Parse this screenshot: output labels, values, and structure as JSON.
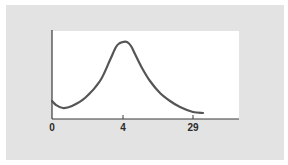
{
  "chart_data": {
    "type": "line",
    "title": "",
    "xlabel": "",
    "ylabel": "",
    "x_tick_labels": [
      "0",
      "4",
      "29"
    ],
    "x_tick_positions_px": [
      52,
      123,
      193
    ],
    "grid": false,
    "legend": null,
    "series": [
      {
        "name": "curve",
        "color": "#555555",
        "description": "Smooth unimodal curve: starts moderately low at x=0, dips slightly, rises to a peak at x=4, then decays toward near-baseline by x=29",
        "points_px": [
          [
            52,
            101
          ],
          [
            56,
            105
          ],
          [
            63,
            108
          ],
          [
            72,
            106
          ],
          [
            85,
            98
          ],
          [
            100,
            81
          ],
          [
            110,
            60
          ],
          [
            116,
            47
          ],
          [
            120,
            43
          ],
          [
            123,
            42
          ],
          [
            127,
            42
          ],
          [
            131,
            46
          ],
          [
            135,
            54
          ],
          [
            142,
            68
          ],
          [
            150,
            81
          ],
          [
            160,
            93
          ],
          [
            170,
            101
          ],
          [
            180,
            107
          ],
          [
            193,
            112
          ],
          [
            203,
            113
          ]
        ],
        "relative_y": [
          0.21,
          0.16,
          0.13,
          0.15,
          0.24,
          0.43,
          0.67,
          0.82,
          0.86,
          0.88,
          0.88,
          0.83,
          0.74,
          0.58,
          0.43,
          0.3,
          0.2,
          0.14,
          0.08,
          0.07
        ]
      }
    ],
    "axes": {
      "x_axis_px": {
        "x1": 52,
        "x2": 239,
        "y": 119
      },
      "y_axis_px": {
        "x": 52,
        "y1": 30,
        "y2": 119
      }
    }
  },
  "colors": {
    "panel": "#e3e3e3",
    "plot_background": "#ffffff",
    "axis": "#3a3a3a",
    "curve": "#555555",
    "label": "#2b2b2b"
  }
}
